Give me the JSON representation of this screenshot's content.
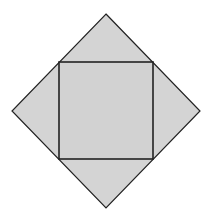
{
  "diagram": {
    "colors": {
      "fill": "#d4d4d4",
      "stroke": "#222222",
      "background": "#ffffff"
    },
    "outer_diamond": {
      "vertices": [
        [
          106,
          14
        ],
        [
          200,
          111
        ],
        [
          106,
          208
        ],
        [
          12,
          111
        ]
      ]
    },
    "inner_square": {
      "x": 59,
      "y": 62,
      "width": 94,
      "height": 97
    }
  }
}
